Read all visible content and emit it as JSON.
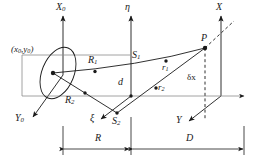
{
  "figure": {
    "type": "optical-ray-geometry-diagram",
    "background": "#ffffff",
    "stroke": "#1a1a1a",
    "axes": {
      "x0": "X",
      "x0_sub": "0",
      "y0": "Y",
      "y0_sub": "0",
      "eta": "η",
      "xi": "ξ",
      "x": "X",
      "y": "Y"
    },
    "points": {
      "source": "(x",
      "source_sub1": "0",
      "source_mid": ",y",
      "source_sub2": "0",
      "source_end": ")",
      "p": "P"
    },
    "rays": {
      "R1": "R",
      "R1_sub": "1",
      "R2": "R",
      "R2_sub": "2",
      "S1": "S",
      "S1_sub": "1",
      "S2": "S",
      "S2_sub": "2",
      "r1": "r",
      "r1_sub": "1",
      "r2": "r",
      "r2_sub": "2"
    },
    "measures": {
      "d": "d",
      "deltax": "δx",
      "R": "R",
      "D": "D"
    }
  }
}
